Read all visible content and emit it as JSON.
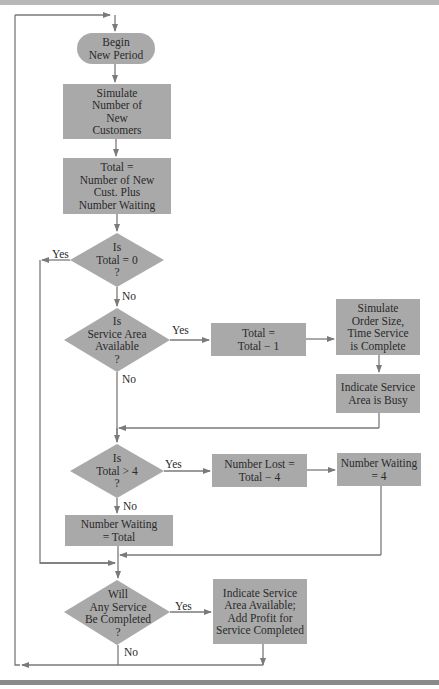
{
  "diagram": {
    "type": "flowchart",
    "colors": {
      "shape_fill": "#a9a9a9",
      "line": "#7a7a7a",
      "text": "#2a2a2a"
    },
    "nodes": {
      "begin": {
        "shape": "terminal",
        "lines": [
          "Begin",
          "New Period"
        ]
      },
      "simulate_customers": {
        "shape": "process",
        "lines": [
          "Simulate",
          "Number of",
          "New",
          "Customers"
        ]
      },
      "compute_total": {
        "shape": "process",
        "lines": [
          "Total =",
          "Number of New",
          "Cust. Plus",
          "Number Waiting"
        ]
      },
      "is_total_zero": {
        "shape": "decision",
        "lines": [
          "Is",
          "Total = 0",
          "?"
        ]
      },
      "is_service_available": {
        "shape": "decision",
        "lines": [
          "Is",
          "Service Area",
          "Available",
          "?"
        ]
      },
      "decrement_total": {
        "shape": "process",
        "lines": [
          "Total =",
          "Total − 1"
        ]
      },
      "simulate_order": {
        "shape": "process",
        "lines": [
          "Simulate",
          "Order Size,",
          "Time Service",
          "is Complete"
        ]
      },
      "indicate_busy": {
        "shape": "process",
        "lines": [
          "Indicate Service",
          "Area is Busy"
        ]
      },
      "is_total_gt_four": {
        "shape": "decision",
        "lines": [
          "Is",
          "Total > 4",
          "?"
        ]
      },
      "number_lost": {
        "shape": "process",
        "lines": [
          "Number Lost =",
          "Total − 4"
        ]
      },
      "waiting_four": {
        "shape": "process",
        "lines": [
          "Number Waiting",
          "= 4"
        ]
      },
      "waiting_total": {
        "shape": "process",
        "lines": [
          "Number Waiting",
          "= Total"
        ]
      },
      "will_service_complete": {
        "shape": "decision",
        "lines": [
          "Will",
          "Any Service",
          "Be Completed",
          "?"
        ]
      },
      "indicate_available": {
        "shape": "process",
        "lines": [
          "Indicate Service",
          "Area Available;",
          "Add Profit for",
          "Service Completed"
        ]
      }
    },
    "edge_labels": {
      "zero_yes": "Yes",
      "zero_no": "No",
      "available_yes": "Yes",
      "available_no": "No",
      "gt_four_yes": "Yes",
      "gt_four_no": "No",
      "complete_yes": "Yes",
      "complete_no": "No"
    }
  }
}
